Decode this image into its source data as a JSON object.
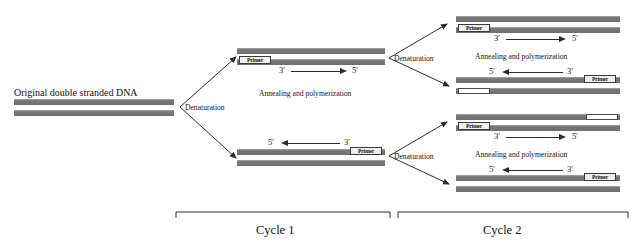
{
  "figure": {
    "type": "pcr-cycle-diagram",
    "source_label": "Original double stranded DNA"
  },
  "colors": {
    "strand_gray": "#6e6e6e",
    "strand_highlight": "#9a9a9a",
    "new_strand_white": "#ffffff",
    "ink": "#1a1a1a",
    "line": "#2b2b2b"
  },
  "start": {
    "title": "Original double stranded DNA"
  },
  "steps": {
    "denaturation": "Denaturation",
    "annealing": "Annealing and polymerization"
  },
  "primer": {
    "label": "Primer"
  },
  "ends": {
    "three_prime": "3'",
    "five_prime": "5'"
  },
  "cycle1": {
    "label": "Cycle 1",
    "denaturation": "Denaturation",
    "upper": {
      "annealing": "Annealing and polymerization",
      "primer": "Primer",
      "left_end": "3'",
      "right_end": "5'",
      "direction": "right"
    },
    "lower": {
      "annealing": "Annealing and polymerization",
      "primer": "Primer",
      "left_end": "5'",
      "right_end": "3'",
      "direction": "left"
    }
  },
  "cycle2": {
    "label": "Cycle 2",
    "upper_branch": {
      "denaturation": "Denaturation",
      "top": {
        "annealing": "Annealing and polymerization",
        "primer": "Primer",
        "left_end": "3'",
        "right_end": "5'",
        "direction": "right"
      },
      "bottom": {
        "annealing": "Annealing and polymerization",
        "primer": "Primer",
        "left_end": "5'",
        "right_end": "3'",
        "direction": "left"
      }
    },
    "lower_branch": {
      "denaturation": "Denaturation",
      "top": {
        "annealing": "Annealing and polymerization",
        "primer": "Primer",
        "left_end": "3'",
        "right_end": "5'",
        "direction": "right"
      },
      "bottom": {
        "annealing": "Annealing and polymerization",
        "primer": "Primer",
        "left_end": "5'",
        "right_end": "3'",
        "direction": "left"
      }
    }
  }
}
